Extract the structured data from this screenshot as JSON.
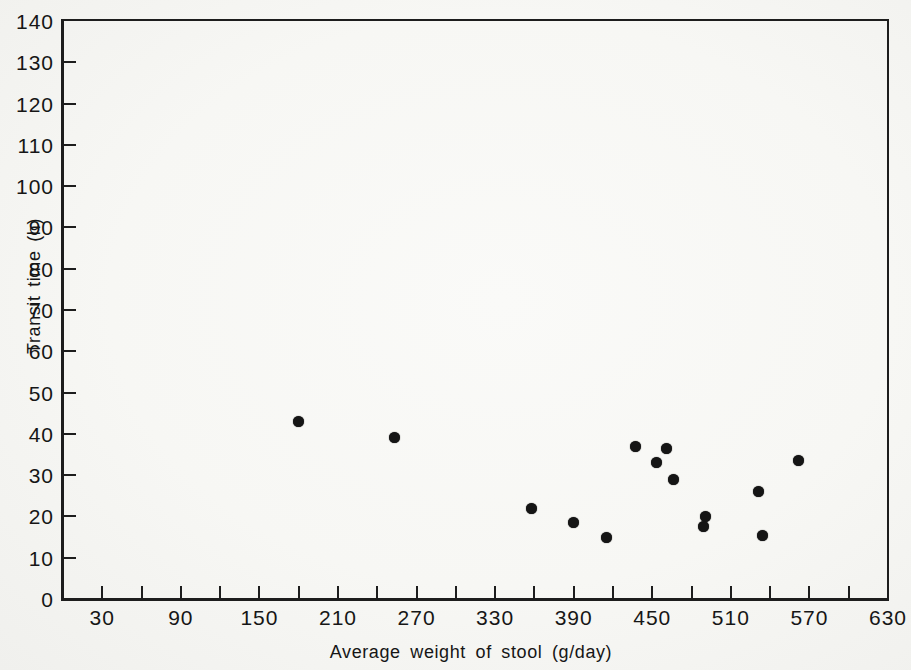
{
  "figure": {
    "background_color": "#f7f7f4",
    "ink_color": "#1d1d1d",
    "marker_color": "#151515"
  },
  "chart_data": {
    "type": "scatter",
    "title": "",
    "xlabel": "Average weight of stool (g/day)",
    "ylabel": "Transit time (h)",
    "xlim": [
      0,
      630
    ],
    "ylim": [
      0,
      140
    ],
    "grid": false,
    "legend": null,
    "frame": "full-box",
    "marker": {
      "shape": "filled-circle",
      "diameter_px": 11
    },
    "x_labeled_ticks": [
      30,
      90,
      150,
      210,
      270,
      330,
      390,
      450,
      510,
      570,
      630
    ],
    "x_minor_ticks": [
      30,
      60,
      90,
      120,
      150,
      180,
      210,
      240,
      270,
      300,
      330,
      360,
      390,
      420,
      450,
      480,
      510,
      540,
      570,
      600
    ],
    "y_ticks": [
      0,
      10,
      20,
      30,
      40,
      50,
      60,
      70,
      80,
      90,
      100,
      110,
      120,
      130,
      140
    ],
    "points": [
      {
        "x": 180,
        "y": 43
      },
      {
        "x": 253,
        "y": 39
      },
      {
        "x": 358,
        "y": 22
      },
      {
        "x": 390,
        "y": 18.5
      },
      {
        "x": 415,
        "y": 15
      },
      {
        "x": 437,
        "y": 37
      },
      {
        "x": 453,
        "y": 33
      },
      {
        "x": 461,
        "y": 36.5
      },
      {
        "x": 466,
        "y": 29
      },
      {
        "x": 489,
        "y": 17.5
      },
      {
        "x": 491,
        "y": 20
      },
      {
        "x": 531,
        "y": 26
      },
      {
        "x": 534,
        "y": 15.5
      },
      {
        "x": 562,
        "y": 33.5
      }
    ]
  }
}
